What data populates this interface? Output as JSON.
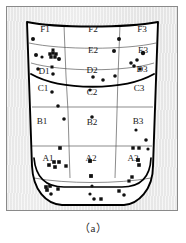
{
  "figure": {
    "caption": "（a）",
    "background_color": "#ebebeb",
    "frame_color": "#8a8a8a",
    "shape_color": "#000000",
    "grid_color": "#555555",
    "marker_color": "#111111"
  },
  "zones": [
    {
      "id": "F1",
      "label": "F1",
      "x": 39,
      "y": 26
    },
    {
      "id": "F2",
      "label": "F2",
      "x": 87,
      "y": 26
    },
    {
      "id": "F3",
      "label": "F3",
      "x": 136,
      "y": 26
    },
    {
      "id": "E2",
      "label": "E2",
      "x": 87,
      "y": 47
    },
    {
      "id": "E3",
      "label": "E3",
      "x": 137,
      "y": 47
    },
    {
      "id": "D1",
      "label": "D1",
      "x": 38,
      "y": 68
    },
    {
      "id": "D2",
      "label": "D2",
      "x": 86,
      "y": 67
    },
    {
      "id": "D3",
      "label": "D3",
      "x": 136,
      "y": 66
    },
    {
      "id": "C1",
      "label": "C1",
      "x": 37,
      "y": 85
    },
    {
      "id": "C2",
      "label": "C2",
      "x": 86,
      "y": 89
    },
    {
      "id": "C3",
      "label": "C3",
      "x": 133,
      "y": 85
    },
    {
      "id": "B1",
      "label": "B1",
      "x": 36,
      "y": 118
    },
    {
      "id": "B2",
      "label": "B2",
      "x": 86,
      "y": 119
    },
    {
      "id": "B3",
      "label": "B3",
      "x": 132,
      "y": 118
    },
    {
      "id": "A1",
      "label": "A1",
      "x": 42,
      "y": 155
    },
    {
      "id": "A2",
      "label": "A2",
      "x": 85,
      "y": 155
    },
    {
      "id": "A3",
      "label": "A3",
      "x": 127,
      "y": 155
    }
  ],
  "markers": {
    "dots": [
      {
        "x": 27,
        "y": 33,
        "r": 2.0
      },
      {
        "x": 30,
        "y": 49,
        "r": 2.0
      },
      {
        "x": 36,
        "y": 51,
        "r": 1.6
      },
      {
        "x": 53,
        "y": 53,
        "r": 2.0
      },
      {
        "x": 32,
        "y": 63,
        "r": 1.8
      },
      {
        "x": 47,
        "y": 68,
        "r": 1.8
      },
      {
        "x": 46,
        "y": 86,
        "r": 1.8
      },
      {
        "x": 52,
        "y": 100,
        "r": 1.8
      },
      {
        "x": 58,
        "y": 113,
        "r": 1.8
      },
      {
        "x": 87,
        "y": 71,
        "r": 1.8
      },
      {
        "x": 84,
        "y": 84,
        "r": 1.6
      },
      {
        "x": 86,
        "y": 111,
        "r": 1.8
      },
      {
        "x": 97,
        "y": 74,
        "r": 1.8
      },
      {
        "x": 109,
        "y": 70,
        "r": 1.8
      },
      {
        "x": 113,
        "y": 33,
        "r": 2.0
      },
      {
        "x": 108,
        "y": 45,
        "r": 2.0
      },
      {
        "x": 125,
        "y": 57,
        "r": 1.8
      },
      {
        "x": 128,
        "y": 60,
        "r": 1.8
      },
      {
        "x": 131,
        "y": 54,
        "r": 1.8
      },
      {
        "x": 134,
        "y": 63,
        "r": 1.8
      },
      {
        "x": 137,
        "y": 47,
        "r": 2.2
      },
      {
        "x": 140,
        "y": 134,
        "r": 1.8
      },
      {
        "x": 130,
        "y": 124,
        "r": 1.6
      },
      {
        "x": 142,
        "y": 143,
        "r": 1.6
      },
      {
        "x": 86,
        "y": 180,
        "r": 1.6
      },
      {
        "x": 84,
        "y": 188,
        "r": 1.6
      },
      {
        "x": 88,
        "y": 193,
        "r": 1.8
      },
      {
        "x": 45,
        "y": 188,
        "r": 1.8
      },
      {
        "x": 118,
        "y": 189,
        "r": 1.8
      }
    ],
    "squares": [
      {
        "x": 44,
        "y": 48,
        "s": 3.4
      },
      {
        "x": 47,
        "y": 47,
        "s": 3.4
      },
      {
        "x": 50,
        "y": 48,
        "s": 3.4
      },
      {
        "x": 45,
        "y": 51,
        "s": 3.4
      },
      {
        "x": 49,
        "y": 51,
        "s": 3.4
      },
      {
        "x": 47,
        "y": 44,
        "s": 3.0
      },
      {
        "x": 46,
        "y": 61,
        "s": 3.0
      },
      {
        "x": 54,
        "y": 142,
        "s": 3.6
      },
      {
        "x": 48,
        "y": 156,
        "s": 3.6
      },
      {
        "x": 53,
        "y": 156,
        "s": 3.6
      },
      {
        "x": 43,
        "y": 159,
        "s": 3.6
      },
      {
        "x": 49,
        "y": 161,
        "s": 3.6
      },
      {
        "x": 60,
        "y": 160,
        "s": 3.4
      },
      {
        "x": 40,
        "y": 181,
        "s": 3.6
      },
      {
        "x": 44,
        "y": 180,
        "s": 3.6
      },
      {
        "x": 41,
        "y": 184,
        "s": 3.6
      },
      {
        "x": 52,
        "y": 183,
        "s": 3.4
      },
      {
        "x": 84,
        "y": 155,
        "s": 3.8
      },
      {
        "x": 85,
        "y": 170,
        "s": 3.8
      },
      {
        "x": 95,
        "y": 193,
        "s": 3.4
      },
      {
        "x": 127,
        "y": 142,
        "s": 3.4
      },
      {
        "x": 133,
        "y": 142,
        "s": 3.4
      },
      {
        "x": 132,
        "y": 154,
        "s": 3.8
      },
      {
        "x": 133,
        "y": 159,
        "s": 3.6
      },
      {
        "x": 126,
        "y": 171,
        "s": 3.4
      },
      {
        "x": 123,
        "y": 175,
        "s": 3.2
      },
      {
        "x": 113,
        "y": 185,
        "s": 3.4
      }
    ]
  }
}
